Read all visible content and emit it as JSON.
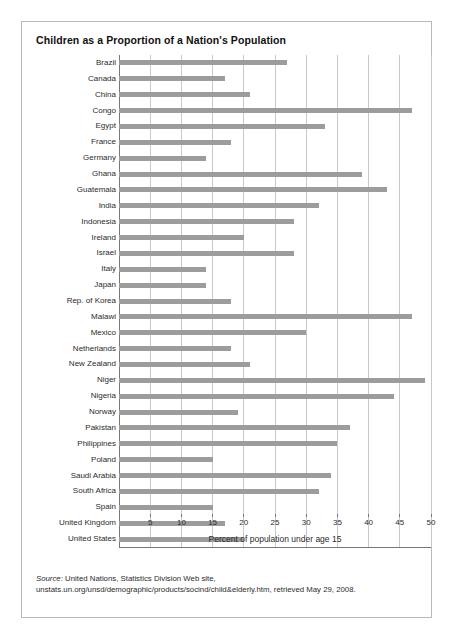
{
  "figure": {
    "title": "Children as a Proportion of a Nation's Population",
    "source_label": "Source:",
    "source_text": " United Nations, Statistics Division Web site, unstats.un.org/unsd/demographic/products/socind/child&elderly.htm, retrieved May 29, 2008."
  },
  "colors": {
    "bar": "#9c9c9c",
    "gridline": "#c8c8c8",
    "axis": "#777777",
    "border": "#b9b9b9",
    "text": "#2b2b2b"
  },
  "chart_data": {
    "type": "bar",
    "orientation": "horizontal",
    "title": "Children as a Proportion of a Nation's Population",
    "xlabel": "Percent of population under age 15",
    "ylabel": "",
    "xlim": [
      0,
      50
    ],
    "xticks": [
      5,
      10,
      15,
      20,
      25,
      30,
      35,
      40,
      45,
      50
    ],
    "grid": true,
    "legend": false,
    "categories": [
      "Brazil",
      "Canada",
      "China",
      "Congo",
      "Egypt",
      "France",
      "Germany",
      "Ghana",
      "Guatemala",
      "India",
      "Indonesia",
      "Ireland",
      "Israel",
      "Italy",
      "Japan",
      "Rep. of Korea",
      "Malawi",
      "Mexico",
      "Netherlands",
      "New Zealand",
      "Niger",
      "Nigeria",
      "Norway",
      "Pakistan",
      "Philippines",
      "Poland",
      "Saudi Arabia",
      "South Africa",
      "Spain",
      "United Kingdom",
      "United States"
    ],
    "values": [
      27,
      17,
      21,
      47,
      33,
      18,
      14,
      39,
      43,
      32,
      28,
      20,
      28,
      14,
      14,
      18,
      47,
      30,
      18,
      21,
      49,
      44,
      19,
      37,
      35,
      15,
      34,
      32,
      15,
      17,
      20
    ]
  }
}
